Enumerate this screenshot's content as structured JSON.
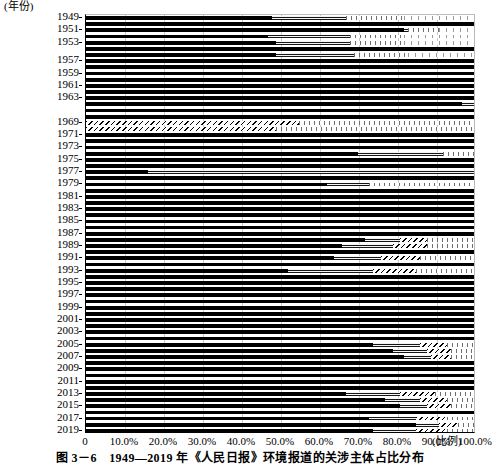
{
  "figure": {
    "caption": "图 3－6　1949—2019 年《人民日报》环境报道的关涉主体占比分布",
    "y_axis_unit": "(年份)",
    "x_axis_unit": "(比例)"
  },
  "chart_data": {
    "type": "bar",
    "orientation": "horizontal",
    "stacked": true,
    "normalized": true,
    "title": "图 3－6　1949—2019 年《人民日报》环境报道的关涉主体占比分布",
    "xlabel": "(比例)",
    "ylabel": "(年份)",
    "xlim": [
      0,
      100
    ],
    "ylim_categories": "1949-2019",
    "grid": "vertical",
    "legend": "none",
    "x_ticks": [
      "0",
      "10.0%",
      "20.0%",
      "30.0%",
      "40.0%",
      "50.0%",
      "60.0%",
      "70.0%",
      "80.0%",
      "90.0%",
      "100.0%"
    ],
    "x_tick_values": [
      0,
      10,
      20,
      30,
      40,
      50,
      60,
      70,
      80,
      90,
      100
    ],
    "y_tick_labels": [
      "1949",
      "1951",
      "1953",
      "1957",
      "1959",
      "1961",
      "1963",
      "1969",
      "1971",
      "1973",
      "1975",
      "1977",
      "1979",
      "1981",
      "1983",
      "1985",
      "1987",
      "1989",
      "1991",
      "1993",
      "1995",
      "1997",
      "1999",
      "2001",
      "2003",
      "2005",
      "2007",
      "2009",
      "2011",
      "2013",
      "2015",
      "2017",
      "2019"
    ],
    "series": [
      {
        "name": "segment-1",
        "pattern": "solid-black",
        "color": "#000000"
      },
      {
        "name": "segment-2",
        "pattern": "horizontal-line-gray",
        "color": "#8a8a8a"
      },
      {
        "name": "segment-3",
        "pattern": "diagonal-hatch",
        "color": "#ffffff"
      },
      {
        "name": "segment-4",
        "pattern": "vertical-line-dense",
        "color": "#ffffff"
      },
      {
        "name": "segment-5",
        "pattern": "vertical-line-sparse",
        "color": "#ffffff"
      }
    ],
    "categories": [
      "1949",
      "1950",
      "1951",
      "1952",
      "1953",
      "1954",
      "1956",
      "1957",
      "1958",
      "1959",
      "1960",
      "1961",
      "1962",
      "1963",
      "1964",
      "1966",
      "1968",
      "1969",
      "1970",
      "1971",
      "1972",
      "1973",
      "1974",
      "1975",
      "1976",
      "1977",
      "1978",
      "1979",
      "1980",
      "1981",
      "1982",
      "1983",
      "1984",
      "1985",
      "1986",
      "1987",
      "1988",
      "1989",
      "1990",
      "1991",
      "1992",
      "1993",
      "1994",
      "1995",
      "1996",
      "1997",
      "1998",
      "1999",
      "2000",
      "2001",
      "2002",
      "2003",
      "2004",
      "2005",
      "2006",
      "2007",
      "2008",
      "2009",
      "2010",
      "2011",
      "2012",
      "2013",
      "2014",
      "2015",
      "2016",
      "2017",
      "2018",
      "2019"
    ],
    "rows": [
      {
        "year": "1949",
        "values": [
          48,
          19,
          0,
          15,
          18
        ]
      },
      {
        "year": "1950",
        "values": [
          100,
          0,
          0,
          0,
          0
        ]
      },
      {
        "year": "1951",
        "values": [
          82,
          1,
          0,
          8,
          9
        ]
      },
      {
        "year": "1952",
        "values": [
          47,
          21,
          0,
          14,
          18
        ]
      },
      {
        "year": "1953",
        "values": [
          49,
          19,
          0,
          14,
          18
        ]
      },
      {
        "year": "1954",
        "values": [
          100,
          0,
          0,
          0,
          0
        ]
      },
      {
        "year": "1956",
        "values": [
          49,
          20,
          0,
          14,
          17
        ]
      },
      {
        "year": "1957",
        "values": [
          100,
          0,
          0,
          0,
          0
        ]
      },
      {
        "year": "1958",
        "values": [
          100,
          0,
          0,
          0,
          0
        ]
      },
      {
        "year": "1959",
        "values": [
          100,
          0,
          0,
          0,
          0
        ]
      },
      {
        "year": "1960",
        "values": [
          100,
          0,
          0,
          0,
          0
        ]
      },
      {
        "year": "1961",
        "values": [
          100,
          0,
          0,
          0,
          0
        ]
      },
      {
        "year": "1962",
        "values": [
          100,
          0,
          0,
          0,
          0
        ]
      },
      {
        "year": "1963",
        "values": [
          100,
          0,
          0,
          0,
          0
        ]
      },
      {
        "year": "1964",
        "values": [
          97,
          3,
          0,
          0,
          0
        ]
      },
      {
        "year": "1966",
        "values": [
          100,
          0,
          0,
          0,
          0
        ]
      },
      {
        "year": "1968",
        "values": [
          100,
          0,
          0,
          0,
          0
        ]
      },
      {
        "year": "1969",
        "values": [
          0,
          0,
          55,
          45,
          0
        ]
      },
      {
        "year": "1970",
        "values": [
          0,
          0,
          49,
          51,
          0
        ]
      },
      {
        "year": "1971",
        "values": [
          100,
          0,
          0,
          0,
          0
        ]
      },
      {
        "year": "1972",
        "values": [
          100,
          0,
          0,
          0,
          0
        ]
      },
      {
        "year": "1973",
        "values": [
          100,
          0,
          0,
          0,
          0
        ]
      },
      {
        "year": "1974",
        "values": [
          70,
          22,
          0,
          8,
          0
        ]
      },
      {
        "year": "1975",
        "values": [
          100,
          0,
          0,
          0,
          0
        ]
      },
      {
        "year": "1976",
        "values": [
          100,
          0,
          0,
          0,
          0
        ]
      },
      {
        "year": "1977",
        "values": [
          16,
          84,
          0,
          0,
          0
        ]
      },
      {
        "year": "1978",
        "values": [
          100,
          0,
          0,
          0,
          0
        ]
      },
      {
        "year": "1979",
        "values": [
          62,
          11,
          0,
          27,
          0
        ]
      },
      {
        "year": "1980",
        "values": [
          100,
          0,
          0,
          0,
          0
        ]
      },
      {
        "year": "1981",
        "values": [
          100,
          0,
          0,
          0,
          0
        ]
      },
      {
        "year": "1982",
        "values": [
          100,
          0,
          0,
          0,
          0
        ]
      },
      {
        "year": "1983",
        "values": [
          100,
          0,
          0,
          0,
          0
        ]
      },
      {
        "year": "1984",
        "values": [
          100,
          0,
          0,
          0,
          0
        ]
      },
      {
        "year": "1985",
        "values": [
          100,
          0,
          0,
          0,
          0
        ]
      },
      {
        "year": "1986",
        "values": [
          100,
          0,
          0,
          0,
          0
        ]
      },
      {
        "year": "1987",
        "values": [
          100,
          0,
          0,
          0,
          0
        ]
      },
      {
        "year": "1988",
        "values": [
          72,
          9,
          7,
          12,
          0
        ]
      },
      {
        "year": "1989",
        "values": [
          66,
          13,
          9,
          12,
          0
        ]
      },
      {
        "year": "1990",
        "values": [
          100,
          0,
          0,
          0,
          0
        ]
      },
      {
        "year": "1991",
        "values": [
          64,
          12,
          10,
          14,
          0
        ]
      },
      {
        "year": "1992",
        "values": [
          100,
          0,
          0,
          0,
          0
        ]
      },
      {
        "year": "1993",
        "values": [
          52,
          22,
          11,
          15,
          0
        ]
      },
      {
        "year": "1994",
        "values": [
          100,
          0,
          0,
          0,
          0
        ]
      },
      {
        "year": "1995",
        "values": [
          100,
          0,
          0,
          0,
          0
        ]
      },
      {
        "year": "1996",
        "values": [
          100,
          0,
          0,
          0,
          0
        ]
      },
      {
        "year": "1997",
        "values": [
          100,
          0,
          0,
          0,
          0
        ]
      },
      {
        "year": "1998",
        "values": [
          100,
          0,
          0,
          0,
          0
        ]
      },
      {
        "year": "1999",
        "values": [
          100,
          0,
          0,
          0,
          0
        ]
      },
      {
        "year": "2000",
        "values": [
          100,
          0,
          0,
          0,
          0
        ]
      },
      {
        "year": "2001",
        "values": [
          100,
          0,
          0,
          0,
          0
        ]
      },
      {
        "year": "2002",
        "values": [
          100,
          0,
          0,
          0,
          0
        ]
      },
      {
        "year": "2003",
        "values": [
          100,
          0,
          0,
          0,
          0
        ]
      },
      {
        "year": "2004",
        "values": [
          100,
          0,
          0,
          0,
          0
        ]
      },
      {
        "year": "2005",
        "values": [
          74,
          12,
          7,
          7,
          0
        ]
      },
      {
        "year": "2006",
        "values": [
          79,
          9,
          6,
          6,
          0
        ]
      },
      {
        "year": "2007",
        "values": [
          82,
          7,
          5,
          6,
          0
        ]
      },
      {
        "year": "2008",
        "values": [
          100,
          0,
          0,
          0,
          0
        ]
      },
      {
        "year": "2009",
        "values": [
          100,
          0,
          0,
          0,
          0
        ]
      },
      {
        "year": "2010",
        "values": [
          100,
          0,
          0,
          0,
          0
        ]
      },
      {
        "year": "2011",
        "values": [
          100,
          0,
          0,
          0,
          0
        ]
      },
      {
        "year": "2012",
        "values": [
          100,
          0,
          0,
          0,
          0
        ]
      },
      {
        "year": "2013",
        "values": [
          67,
          14,
          9,
          10,
          0
        ]
      },
      {
        "year": "2014",
        "values": [
          77,
          9,
          7,
          7,
          0
        ]
      },
      {
        "year": "2015",
        "values": [
          81,
          7,
          6,
          6,
          0
        ]
      },
      {
        "year": "2016",
        "values": [
          100,
          0,
          0,
          0,
          0
        ]
      },
      {
        "year": "2017",
        "values": [
          73,
          12,
          8,
          7,
          0
        ]
      },
      {
        "year": "2018",
        "values": [
          85,
          6,
          5,
          4,
          0
        ]
      },
      {
        "year": "2019",
        "values": [
          74,
          11,
          8,
          7,
          0
        ]
      }
    ]
  }
}
